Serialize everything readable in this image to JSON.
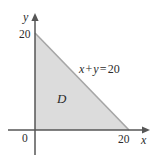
{
  "figure": {
    "type": "math-diagram",
    "background_color": "#ffffff"
  },
  "axes": {
    "x_axis": {
      "label": "x",
      "label_name": "x-axis-label",
      "arrow": "right",
      "color": "#4a4a4a"
    },
    "y_axis": {
      "label": "y",
      "label_name": "y-axis-label",
      "arrow": "up",
      "color": "#4a4a4a"
    },
    "origin_label": "0"
  },
  "ticks": {
    "x": [
      {
        "value": 20,
        "label": "20"
      }
    ],
    "y": [
      {
        "value": 20,
        "label": "20"
      }
    ]
  },
  "region": {
    "name": "D",
    "fill_color": "#dcdcdc",
    "edge_color": "#a6a6a6",
    "vertices": [
      {
        "x": 0,
        "y": 0
      },
      {
        "x": 0,
        "y": 20
      },
      {
        "x": 20,
        "y": 0
      }
    ]
  },
  "annotations": {
    "boundary_line": {
      "equation_parts": {
        "lhs_var1": "x",
        "operator_plus": "+",
        "lhs_var2": "y",
        "operator_equals": "=",
        "rhs_value": "20"
      },
      "equation_text": "x + y = 20"
    }
  },
  "chart_data": {
    "type": "area",
    "title": "",
    "xlabel": "x",
    "ylabel": "y",
    "xlim": [
      0,
      23
    ],
    "ylim": [
      0,
      23
    ],
    "grid": false,
    "legend": null,
    "xticks": [
      0,
      20
    ],
    "xticklabels": [
      "0",
      "20"
    ],
    "yticks": [
      20
    ],
    "yticklabels": [
      "20"
    ],
    "series": [
      {
        "name": "x + y = 20",
        "x": [
          0,
          20
        ],
        "y": [
          20,
          0
        ],
        "fill_to": 0,
        "fill_color": "#dcdcdc",
        "line_color": "#a6a6a6"
      }
    ],
    "annotations": [
      {
        "text": "D",
        "x": 6.0,
        "y": 7.3,
        "style": "italic"
      },
      {
        "text": "x + y = 20",
        "x": 10.4,
        "y": 14.2,
        "style": "equation"
      }
    ]
  }
}
